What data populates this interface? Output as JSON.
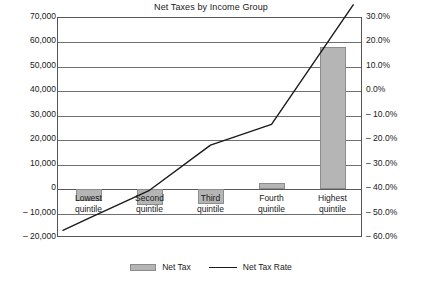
{
  "chart_data": {
    "type": "bar",
    "title": "Net Taxes by Income Group",
    "xlabel": "",
    "ylabel": "",
    "categories": [
      "Lowest quintile",
      "Second quintile",
      "Third quintile",
      "Fourth quintile",
      "Highest quintile"
    ],
    "category_lines": [
      [
        "Lowest",
        "quintile"
      ],
      [
        "Second",
        "quintile"
      ],
      [
        "Third",
        "quintile"
      ],
      [
        "Fourth",
        "quintile"
      ],
      [
        "Highest",
        "quintile"
      ]
    ],
    "series": [
      {
        "name": "Net Tax",
        "type": "bar",
        "axis": "left",
        "color": "#b5b5b5",
        "values": [
          -5000,
          -6500,
          -6000,
          2500,
          58000
        ]
      },
      {
        "name": "Net Tax Rate",
        "type": "line",
        "axis": "right",
        "color": "#1a1a1a",
        "values": [
          -52.0,
          -40.5,
          -22.0,
          -13.5,
          23.0
        ]
      }
    ],
    "left_axis": {
      "ylim": [
        -20000,
        70000
      ],
      "step": 10000,
      "ticks": [
        "70,000",
        "60,000",
        "50,000",
        "40,000",
        "30,000",
        "20,000",
        "10,000",
        "0",
        "– 10,000",
        "– 20,000"
      ],
      "tick_values": [
        70000,
        60000,
        50000,
        40000,
        30000,
        20000,
        10000,
        0,
        -10000,
        -20000
      ]
    },
    "right_axis": {
      "ylim": [
        -60.0,
        30.0
      ],
      "step": 10.0,
      "ticks": [
        "30.0%",
        "20.0%",
        "10.0%",
        "0.0%",
        "– 10.0%",
        "– 20.0%",
        "– 30.0%",
        "– 40.0%",
        "– 50.0%",
        "– 60.0%"
      ],
      "tick_values": [
        30.0,
        20.0,
        10.0,
        0.0,
        -10.0,
        -20.0,
        -30.0,
        -40.0,
        -50.0,
        -60.0
      ]
    },
    "grid": true,
    "legend_position": "bottom",
    "legend": [
      {
        "label": "Net Tax",
        "marker": "bar-swatch"
      },
      {
        "label": "Net Tax Rate",
        "marker": "line-swatch"
      }
    ]
  }
}
